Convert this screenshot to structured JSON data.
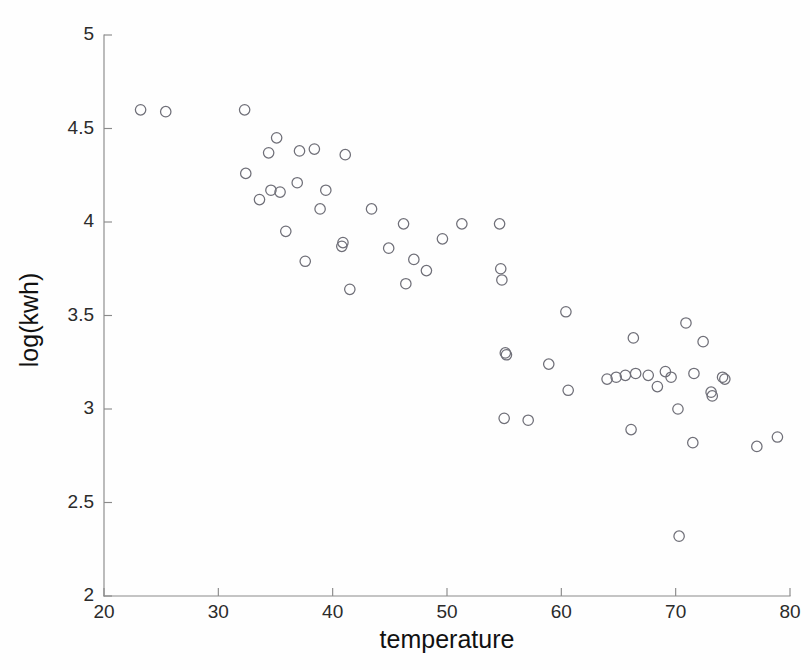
{
  "chart_data": {
    "type": "scatter",
    "title": "",
    "xlabel": "temperature",
    "ylabel": "log(kwh)",
    "xlim": [
      20,
      80
    ],
    "ylim": [
      2,
      5
    ],
    "xticks": [
      20,
      30,
      40,
      50,
      60,
      70,
      80
    ],
    "yticks": [
      2,
      2.5,
      3,
      3.5,
      4,
      4.5,
      5
    ],
    "xtick_labels": [
      "20",
      "30",
      "40",
      "50",
      "60",
      "70",
      "80"
    ],
    "ytick_labels": [
      "2",
      "2.5",
      "3",
      "3.5",
      "4",
      "4.5",
      "5"
    ],
    "grid": false,
    "legend": null,
    "marker": "open-circle",
    "marker_color": "#6f6f78",
    "series": [
      {
        "name": "observations",
        "points": [
          [
            23.2,
            4.6
          ],
          [
            25.4,
            4.59
          ],
          [
            32.3,
            4.6
          ],
          [
            32.4,
            4.26
          ],
          [
            33.6,
            4.12
          ],
          [
            34.4,
            4.37
          ],
          [
            34.6,
            4.17
          ],
          [
            35.1,
            4.45
          ],
          [
            35.4,
            4.16
          ],
          [
            35.9,
            3.95
          ],
          [
            36.9,
            4.21
          ],
          [
            37.1,
            4.38
          ],
          [
            37.6,
            3.79
          ],
          [
            38.4,
            4.39
          ],
          [
            38.9,
            4.07
          ],
          [
            39.4,
            4.17
          ],
          [
            40.8,
            3.87
          ],
          [
            40.9,
            3.89
          ],
          [
            41.1,
            4.36
          ],
          [
            41.5,
            3.64
          ],
          [
            43.4,
            4.07
          ],
          [
            44.9,
            3.86
          ],
          [
            46.2,
            3.99
          ],
          [
            46.4,
            3.67
          ],
          [
            47.1,
            3.8
          ],
          [
            48.2,
            3.74
          ],
          [
            49.6,
            3.91
          ],
          [
            51.3,
            3.99
          ],
          [
            54.6,
            3.99
          ],
          [
            54.7,
            3.75
          ],
          [
            54.8,
            3.69
          ],
          [
            55.0,
            2.95
          ],
          [
            55.1,
            3.3
          ],
          [
            55.2,
            3.29
          ],
          [
            57.1,
            2.94
          ],
          [
            58.9,
            3.24
          ],
          [
            60.4,
            3.52
          ],
          [
            60.6,
            3.1
          ],
          [
            64.0,
            3.16
          ],
          [
            64.8,
            3.17
          ],
          [
            65.6,
            3.18
          ],
          [
            66.1,
            2.89
          ],
          [
            66.3,
            3.38
          ],
          [
            66.5,
            3.19
          ],
          [
            67.6,
            3.18
          ],
          [
            68.4,
            3.12
          ],
          [
            69.1,
            3.2
          ],
          [
            69.6,
            3.17
          ],
          [
            70.2,
            3.0
          ],
          [
            70.3,
            2.32
          ],
          [
            70.9,
            3.46
          ],
          [
            71.5,
            2.82
          ],
          [
            71.6,
            3.19
          ],
          [
            72.4,
            3.36
          ],
          [
            73.1,
            3.09
          ],
          [
            73.2,
            3.07
          ],
          [
            74.1,
            3.17
          ],
          [
            74.3,
            3.16
          ],
          [
            77.1,
            2.8
          ],
          [
            78.9,
            2.85
          ]
        ]
      }
    ]
  },
  "figure": {
    "axis_color": "#8a8a8a",
    "background": "#ffffff"
  }
}
